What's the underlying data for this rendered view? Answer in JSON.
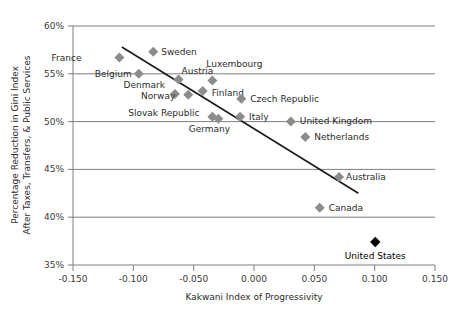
{
  "chart_data": {
    "type": "scatter",
    "title": "",
    "xlabel": "Kakwani Index of Progressivity",
    "ylabel": "Percentage Reduction in Gini Index\nAfter Taxes, Transfers, & Public Services",
    "ylabel_line1": "Percentage Reduction in Gini Index",
    "ylabel_line2": "After Taxes, Transfers, & Public Services",
    "xlim": [
      -0.15,
      0.15
    ],
    "ylim": [
      35,
      60
    ],
    "xticks": [
      -0.15,
      -0.1,
      -0.05,
      0.0,
      0.05,
      0.1,
      0.15
    ],
    "xtick_labels": [
      "-0.150",
      "-0.100",
      "-0.050",
      "0.000",
      "0.050",
      "0.100",
      "0.150"
    ],
    "yticks": [
      35,
      40,
      45,
      50,
      55,
      60
    ],
    "ytick_labels": [
      "35%",
      "40%",
      "45%",
      "50%",
      "55%",
      "60%"
    ],
    "grid": "horizontal",
    "legend": "none",
    "marker_color": "#8c8c8c",
    "highlight_color": "#000000",
    "trendline_color": "#1a1a1a",
    "points": [
      {
        "name": "France",
        "x": -0.1115,
        "y": 56.7,
        "label_dx": -38,
        "label_dy": 3,
        "anchor": "end",
        "highlight": false
      },
      {
        "name": "Sweden",
        "x": -0.0835,
        "y": 57.3,
        "label_dx": 8,
        "label_dy": 3,
        "anchor": "start",
        "highlight": false
      },
      {
        "name": "Belgium",
        "x": -0.0955,
        "y": 55.0,
        "label_dx": -7,
        "label_dy": 3,
        "anchor": "end",
        "highlight": false
      },
      {
        "name": "Austria",
        "x": -0.0625,
        "y": 54.4,
        "label_dx": 3,
        "label_dy": -6,
        "anchor": "start",
        "highlight": false
      },
      {
        "name": "Luxembourg",
        "x": -0.0345,
        "y": 54.3,
        "label_dx": -6,
        "label_dy": -13,
        "anchor": "start",
        "highlight": false
      },
      {
        "name": "Denmark",
        "x": -0.0655,
        "y": 52.9,
        "label_dx": -10,
        "label_dy": -6,
        "anchor": "end",
        "highlight": false
      },
      {
        "name": "Norway",
        "x": -0.0545,
        "y": 52.8,
        "label_dx": -13,
        "label_dy": 4,
        "anchor": "end",
        "highlight": false
      },
      {
        "name": "Finland",
        "x": -0.0425,
        "y": 53.2,
        "label_dx": 9,
        "label_dy": 5,
        "anchor": "start",
        "highlight": false
      },
      {
        "name": "Czech Republic",
        "x": -0.0105,
        "y": 52.4,
        "label_dx": 9,
        "label_dy": 3,
        "anchor": "start",
        "highlight": false
      },
      {
        "name": "Slovak Republic",
        "x": -0.0345,
        "y": 50.5,
        "label_dx": -13,
        "label_dy": -1,
        "anchor": "end",
        "highlight": false
      },
      {
        "name": "Germany",
        "x": -0.0295,
        "y": 50.3,
        "label_dx": -9,
        "label_dy": 13,
        "anchor": "middle",
        "highlight": false
      },
      {
        "name": "Italy",
        "x": -0.0115,
        "y": 50.5,
        "label_dx": 9,
        "label_dy": 3,
        "anchor": "start",
        "highlight": false
      },
      {
        "name": "United Kingdom",
        "x": 0.0305,
        "y": 50.0,
        "label_dx": 9,
        "label_dy": 2,
        "anchor": "start",
        "highlight": false
      },
      {
        "name": "Netherlands",
        "x": 0.0425,
        "y": 48.4,
        "label_dx": 9,
        "label_dy": 3,
        "anchor": "start",
        "highlight": false
      },
      {
        "name": "Australia",
        "x": 0.0705,
        "y": 44.2,
        "label_dx": 7,
        "label_dy": 3,
        "anchor": "start",
        "highlight": false
      },
      {
        "name": "Canada",
        "x": 0.0545,
        "y": 41.0,
        "label_dx": 9,
        "label_dy": 3,
        "anchor": "start",
        "highlight": false
      },
      {
        "name": "United States",
        "x": 0.1005,
        "y": 37.4,
        "label_dx": 0,
        "label_dy": 17,
        "anchor": "middle",
        "highlight": true
      }
    ],
    "trendline": {
      "x1": -0.1095,
      "y1": 57.8,
      "x2": 0.0865,
      "y2": 42.5
    }
  }
}
